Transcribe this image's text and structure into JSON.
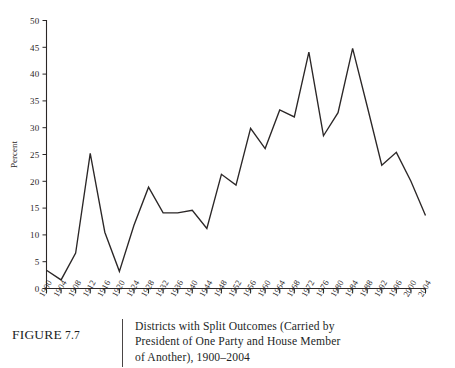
{
  "figure": {
    "label_prefix": "FIGURE",
    "number": "7.7",
    "caption_line1": "Districts with Split Outcomes (Carried by",
    "caption_line2": "President of One Party and House Member",
    "caption_line3": "of Another), 1900–2004"
  },
  "chart_data": {
    "type": "line",
    "title": "Districts with Split Outcomes (Carried by President of One Party and House Member of Another), 1900–2004",
    "xlabel": "",
    "ylabel": "Percent",
    "ylim": [
      0,
      50
    ],
    "yticks": [
      0,
      5,
      10,
      15,
      20,
      25,
      30,
      35,
      40,
      45,
      50
    ],
    "ytick_labels": [
      "0",
      "5",
      "10",
      "15",
      "20",
      "25",
      "30",
      "35",
      "40",
      "45",
      "50"
    ],
    "grid": false,
    "legend": false,
    "line_color": "#2b2727",
    "categories": [
      "1900",
      "1904",
      "1908",
      "1912",
      "1916",
      "1920",
      "1924",
      "1928",
      "1932",
      "1936",
      "1940",
      "1944",
      "1948",
      "1952",
      "1956",
      "1960",
      "1964",
      "1968",
      "1972",
      "1976",
      "1980",
      "1984",
      "1988",
      "1992",
      "1996",
      "2000",
      "2004"
    ],
    "x": [
      1900,
      1904,
      1908,
      1912,
      1916,
      1920,
      1924,
      1928,
      1932,
      1936,
      1940,
      1944,
      1948,
      1952,
      1956,
      1960,
      1964,
      1968,
      1972,
      1976,
      1980,
      1984,
      1988,
      1992,
      1996,
      2000,
      2004
    ],
    "values": [
      3.4,
      1.6,
      6.6,
      25.2,
      10.5,
      3.2,
      11.8,
      18.9,
      14.1,
      14.1,
      14.6,
      11.2,
      21.3,
      19.3,
      29.9,
      26.1,
      33.3,
      32.0,
      44.1,
      28.5,
      32.8,
      44.8,
      34.0,
      23.0,
      25.4,
      20.0,
      13.6
    ],
    "annotations": []
  }
}
